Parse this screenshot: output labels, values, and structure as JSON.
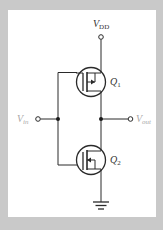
{
  "diagram": {
    "labels": {
      "vdd": {
        "main": "V",
        "sub": "DD"
      },
      "vin": {
        "main": "V",
        "sub": "in"
      },
      "vout": {
        "main": "V",
        "sub": "out"
      },
      "q1": {
        "main": "Q",
        "sub": "1"
      },
      "q2": {
        "main": "Q",
        "sub": "2"
      }
    },
    "components": [
      {
        "id": "Q1",
        "type": "PMOS transistor",
        "position": "top"
      },
      {
        "id": "Q2",
        "type": "NMOS transistor",
        "position": "bottom"
      }
    ],
    "nodes": [
      "VDD",
      "Vin",
      "Vout",
      "GND"
    ],
    "colors": {
      "background": "#c9c9c9",
      "panel": "#ffffff",
      "wire": "#2a2a2a",
      "vdd_label": "#333333",
      "io_label": "#a8a8a8"
    }
  }
}
